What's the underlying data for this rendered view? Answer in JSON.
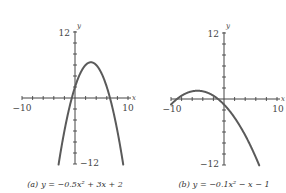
{
  "chart_data": [
    {
      "type": "line",
      "panel": "a",
      "caption_prefix": "(a)",
      "caption": "y = −0.5x² + 3x + 2",
      "equation": {
        "a": -0.5,
        "b": 3,
        "c": 2
      },
      "xlim": [
        -10,
        10
      ],
      "ylim": [
        -12,
        12
      ],
      "x_tick_step": 2,
      "y_tick_step": 2,
      "x_tick_labels": [
        "-10",
        "10"
      ],
      "y_tick_labels": [
        "12",
        "-12"
      ],
      "xlabel": "x",
      "ylabel": "y",
      "grid": false,
      "series": [
        {
          "name": "y = -0.5x^2 + 3x + 2",
          "x": [
            -1.9,
            -1,
            0,
            1,
            2,
            3,
            4,
            5,
            6,
            7,
            7.9
          ],
          "y": [
            -5.5,
            -1.5,
            2,
            4.5,
            6,
            6.5,
            6,
            4.5,
            2,
            -1.5,
            -5.5
          ]
        }
      ]
    },
    {
      "type": "line",
      "panel": "b",
      "caption_prefix": "(b)",
      "caption": "y = −0.1x² − x − 1",
      "equation": {
        "a": -0.1,
        "b": -1,
        "c": -1
      },
      "xlim": [
        -10,
        10
      ],
      "ylim": [
        -12,
        12
      ],
      "x_tick_step": 2,
      "y_tick_step": 2,
      "x_tick_labels": [
        "-10",
        "10"
      ],
      "y_tick_labels": [
        "12",
        "-12"
      ],
      "xlabel": "x",
      "ylabel": "y",
      "grid": false,
      "series": [
        {
          "name": "y = -0.1x^2 - x - 1",
          "x": [
            -10,
            -8,
            -6,
            -5,
            -4,
            -2,
            0,
            2,
            4,
            6,
            7.5
          ],
          "y": [
            -1,
            0.6,
            1.4,
            1.5,
            1.4,
            0.6,
            -1,
            -3.4,
            -6.6,
            -10.6,
            -13.1
          ]
        }
      ]
    }
  ],
  "panels": {
    "a": {
      "y_top": "12",
      "y_bottom": "−12",
      "x_left": "−10",
      "x_right": "10",
      "x_name": "x",
      "y_name": "y",
      "caption_prefix": "(a)",
      "caption": "y = −0.5x² + 3x + 2"
    },
    "b": {
      "y_top": "12",
      "y_bottom": "−12",
      "x_left": "−10",
      "x_right": "10",
      "x_name": "x",
      "y_name": "y",
      "caption_prefix": "(b)",
      "caption": "y = −0.1x² − x − 1"
    }
  },
  "colors": {
    "curve": "#5a5a5a",
    "axis": "#444444",
    "background": "#ffffff"
  }
}
